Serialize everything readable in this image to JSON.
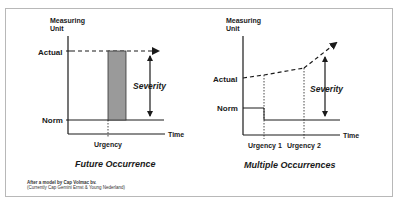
{
  "diagrams": {
    "left": {
      "y_axis_label_line1": "Measuring",
      "y_axis_label_line2": "Unit",
      "actual_label": "Actual",
      "norm_label": "Norm",
      "time_label": "Time",
      "severity_label": "Severity",
      "urgency_label": "Urgency",
      "title": "Future Occurrence"
    },
    "right": {
      "y_axis_label_line1": "Measuring",
      "y_axis_label_line2": "Unit",
      "actual_label": "Actual",
      "norm_label": "Norm",
      "time_label": "Time",
      "severity_label": "Severity",
      "urgency1_label": "Urgency 1",
      "urgency2_label": "Urgency 2",
      "title": "Multiple Occurrences"
    }
  },
  "credit": {
    "line1": "After a model by Cap Volmac bv.",
    "line2": "(Currently Cap Gemini Ernst & Young Nederland)"
  },
  "colors": {
    "line": "#1a1a1a",
    "bar_fill": "#9a9a9a",
    "frame": "#b8b8b8"
  }
}
